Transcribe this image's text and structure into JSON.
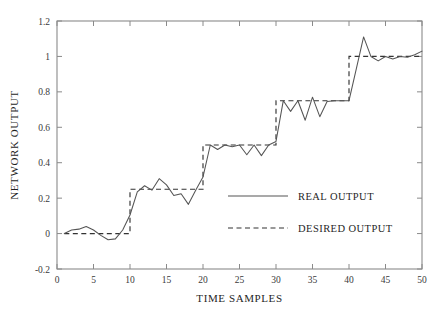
{
  "chart_data": {
    "type": "line",
    "title": "",
    "xlabel": "TIME SAMPLES",
    "ylabel": "NETWORK OUTPUT",
    "xlim": [
      0,
      50
    ],
    "ylim": [
      -0.2,
      1.2
    ],
    "xticks": [
      0,
      5,
      10,
      15,
      20,
      25,
      30,
      35,
      40,
      45,
      50
    ],
    "xticklabels": [
      "0",
      "5",
      "10",
      "15",
      "20",
      "25",
      "30",
      "35",
      "40",
      "45",
      "50"
    ],
    "yticks": [
      -0.2,
      0,
      0.2,
      0.4,
      0.6,
      0.8,
      1,
      1.2
    ],
    "yticklabels": [
      "-0.2",
      "0",
      "0.2",
      "0.4",
      "0.6",
      "0.8",
      "1",
      "1.2"
    ],
    "grid": false,
    "legend_position": "center-right",
    "x": [
      1,
      2,
      3,
      4,
      5,
      6,
      7,
      8,
      9,
      10,
      11,
      12,
      13,
      14,
      15,
      16,
      17,
      18,
      19,
      20,
      21,
      22,
      23,
      24,
      25,
      26,
      27,
      28,
      29,
      30,
      31,
      32,
      33,
      34,
      35,
      36,
      37,
      38,
      39,
      40,
      41,
      42,
      43,
      44,
      45,
      46,
      47,
      48,
      49,
      50
    ],
    "series": [
      {
        "name": "REAL OUTPUT",
        "style": "solid",
        "color": "#555555",
        "values": [
          0.0,
          0.02,
          0.025,
          0.04,
          0.02,
          -0.01,
          -0.035,
          -0.03,
          0.02,
          0.105,
          0.235,
          0.27,
          0.245,
          0.31,
          0.275,
          0.215,
          0.225,
          0.165,
          0.245,
          0.32,
          0.5,
          0.475,
          0.5,
          0.49,
          0.5,
          0.445,
          0.5,
          0.44,
          0.5,
          0.52,
          0.75,
          0.69,
          0.75,
          0.64,
          0.77,
          0.66,
          0.745,
          0.75,
          0.75,
          0.75,
          0.93,
          1.11,
          1.0,
          0.975,
          1.0,
          0.985,
          1.0,
          0.995,
          1.01,
          1.03
        ]
      },
      {
        "name": "DESIRED OUTPUT",
        "style": "dashed",
        "color": "#333333",
        "step_levels": [
          0.0,
          0.25,
          0.5,
          0.75,
          1.0
        ],
        "step_edges": [
          1,
          10,
          20,
          30,
          40,
          50
        ],
        "values": [
          0.0,
          0.0,
          0.0,
          0.0,
          0.0,
          0.0,
          0.0,
          0.0,
          0.0,
          0.0,
          0.25,
          0.25,
          0.25,
          0.25,
          0.25,
          0.25,
          0.25,
          0.25,
          0.25,
          0.25,
          0.5,
          0.5,
          0.5,
          0.5,
          0.5,
          0.5,
          0.5,
          0.5,
          0.5,
          0.5,
          0.75,
          0.75,
          0.75,
          0.75,
          0.75,
          0.75,
          0.75,
          0.75,
          0.75,
          0.75,
          1.0,
          1.0,
          1.0,
          1.0,
          1.0,
          1.0,
          1.0,
          1.0,
          1.0,
          1.0
        ]
      }
    ],
    "legend": [
      {
        "label": "REAL OUTPUT",
        "style": "solid"
      },
      {
        "label": "DESIRED OUTPUT",
        "style": "dashed"
      }
    ]
  },
  "colors": {
    "background": "#ffffff",
    "axis": "#8a8a8a",
    "real_line": "#555555",
    "desired_line": "#333333",
    "text": "#1f1f1f"
  }
}
